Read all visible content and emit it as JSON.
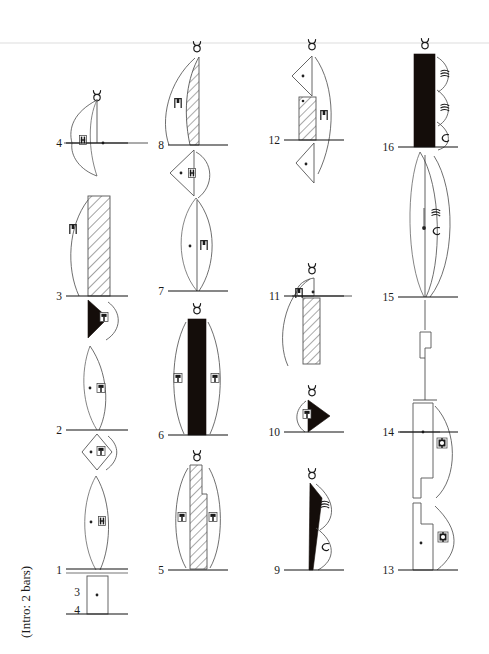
{
  "page": {
    "background_color": "#ffffff",
    "ink_color": "#1a1a1a",
    "accent_black": "#140d0a",
    "width": 489,
    "height": 654
  },
  "annotations": {
    "intro_note": "(Intro: 2 bars)"
  },
  "systems": [
    {
      "id": "system-1",
      "column_index": 1,
      "center_x": 97,
      "barlines": [
        {
          "label": "4",
          "y": 143
        },
        {
          "label": "3",
          "y": 296
        },
        {
          "label": "2",
          "y": 430
        },
        {
          "label": "1",
          "y": 570
        },
        {
          "label": "3",
          "y": 592
        },
        {
          "label": "4",
          "y": 614
        }
      ],
      "events": [
        {
          "label": "4",
          "notehead": "lens-open",
          "top_symbol": "taurus",
          "inner_glyph": "bracket-glyph",
          "dot": true,
          "has_tick": true
        },
        {
          "label": "3",
          "notehead": "bar-hatched",
          "top_symbol": "none",
          "inner_glyph": "hook-glyph",
          "dot": false,
          "has_tick": false
        },
        {
          "label": "2a",
          "notehead": "wedge-black",
          "top_symbol": "none",
          "inner_glyph": "box-glyph",
          "dot": false,
          "has_tick": false
        },
        {
          "label": "2b",
          "notehead": "lens-open",
          "top_symbol": "none",
          "inner_glyph": "box-glyph",
          "dot": true,
          "has_tick": false
        },
        {
          "label": "1a",
          "notehead": "diamond-open",
          "top_symbol": "none",
          "inner_glyph": "box-glyph",
          "dot": true,
          "has_tick": false
        },
        {
          "label": "1b",
          "notehead": "lens-open",
          "top_symbol": "none",
          "inner_glyph": "bracket-glyph",
          "dot": true,
          "has_tick": false
        },
        {
          "label": "intro",
          "notehead": "rect-open",
          "top_symbol": "none",
          "inner_glyph": "none",
          "dot": true,
          "has_tick": false
        }
      ]
    },
    {
      "id": "system-2",
      "column_index": 2,
      "center_x": 197,
      "barlines": [
        {
          "label": "8",
          "y": 145
        },
        {
          "label": "7",
          "y": 291
        },
        {
          "label": "6",
          "y": 435
        },
        {
          "label": "5",
          "y": 570
        }
      ],
      "events": [
        {
          "label": "8",
          "notehead": "blade-hatched",
          "top_symbol": "taurus",
          "inner_glyph": "hook-glyph",
          "dot": false,
          "has_tick": false
        },
        {
          "label": "7a",
          "notehead": "triangle-open",
          "top_symbol": "none",
          "inner_glyph": "bracket-glyph",
          "dot": true,
          "has_tick": false
        },
        {
          "label": "7b",
          "notehead": "lens-open",
          "top_symbol": "none",
          "inner_glyph": "hook-glyph",
          "dot": true,
          "has_tick": false
        },
        {
          "label": "6",
          "notehead": "bar-black",
          "top_symbol": "taurus",
          "inner_glyph": "box-glyph-pair",
          "dot": false,
          "has_tick": false
        },
        {
          "label": "5",
          "notehead": "bar-hatched",
          "top_symbol": "taurus",
          "inner_glyph": "box-glyph-pair",
          "dot": false,
          "has_tick": false
        }
      ]
    },
    {
      "id": "system-3",
      "column_index": 3,
      "center_x": 312,
      "barlines": [
        {
          "label": "12",
          "y": 140
        },
        {
          "label": "11",
          "y": 296
        },
        {
          "label": "10",
          "y": 432
        },
        {
          "label": "9",
          "y": 570
        }
      ],
      "events": [
        {
          "label": "12a",
          "notehead": "triangle-open",
          "top_symbol": "taurus",
          "inner_glyph": "none",
          "dot": true,
          "has_tick": false
        },
        {
          "label": "12b",
          "notehead": "bar-hatched",
          "top_symbol": "none",
          "inner_glyph": "hook-glyph",
          "dot": true,
          "has_tick": false
        },
        {
          "label": "12c",
          "notehead": "triangle-open",
          "top_symbol": "none",
          "inner_glyph": "none",
          "dot": true,
          "has_tick": false
        },
        {
          "label": "11a",
          "notehead": "blade-open",
          "top_symbol": "taurus",
          "inner_glyph": "none",
          "dot": true,
          "has_tick": true
        },
        {
          "label": "11b",
          "notehead": "bar-hatched",
          "top_symbol": "none",
          "inner_glyph": "hook-glyph",
          "dot": false,
          "has_tick": false
        },
        {
          "label": "10",
          "notehead": "wedge-black",
          "top_symbol": "taurus",
          "inner_glyph": "box-glyph",
          "dot": false,
          "has_tick": false
        },
        {
          "label": "9",
          "notehead": "spike-black",
          "top_symbol": "taurus",
          "inner_glyph": "script-pair",
          "dot": false,
          "has_tick": false
        }
      ]
    },
    {
      "id": "system-4",
      "column_index": 4,
      "center_x": 425,
      "barlines": [
        {
          "label": "16",
          "y": 147
        },
        {
          "label": "15",
          "y": 297
        },
        {
          "label": "14",
          "y": 432
        },
        {
          "label": "13",
          "y": 570
        }
      ],
      "events": [
        {
          "label": "16",
          "notehead": "bar-black",
          "top_symbol": "taurus",
          "inner_glyph": "script-triple",
          "dot": false,
          "has_tick": false
        },
        {
          "label": "15",
          "notehead": "lens-open",
          "top_symbol": "none",
          "inner_glyph": "script-pair",
          "dot": true,
          "has_tick": false
        },
        {
          "label": "15-rest",
          "notehead": "rest-flag",
          "top_symbol": "none",
          "inner_glyph": "none",
          "dot": false,
          "has_tick": false
        },
        {
          "label": "14",
          "notehead": "step-open",
          "top_symbol": "none",
          "inner_glyph": "ring-glyph",
          "dot": true,
          "has_tick": true
        },
        {
          "label": "13",
          "notehead": "step-open",
          "top_symbol": "none",
          "inner_glyph": "ring-glyph",
          "dot": true,
          "has_tick": false
        }
      ]
    }
  ],
  "legend": {
    "taurus_symbol": "taurus-symbol",
    "notehead_types": [
      "lens-open",
      "bar-hatched",
      "bar-black",
      "wedge-black",
      "spike-black",
      "triangle-open",
      "diamond-open",
      "rect-open",
      "blade-hatched",
      "blade-open",
      "step-open",
      "rest-flag"
    ]
  }
}
